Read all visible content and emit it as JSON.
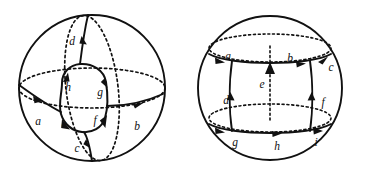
{
  "figure": {
    "title": "Two spheres with directed edge decompositions",
    "background_color": "#ffffff",
    "ink_color": "#111111",
    "panels": [
      {
        "id": "left-sphere",
        "name": "sphere-with-inner-loop",
        "center": [
          92,
          88
        ],
        "radius": 73,
        "description": "Sphere outline with dashed equator and dashed meridian, an inner rounded quadrilateral loop, and four edges joining the loop to the sphere.",
        "outer_boundary": "solid circle",
        "hidden_curves": [
          "dashed equator ellipse",
          "dashed meridian ellipse"
        ],
        "inner_region": "rounded quadrilateral loop",
        "edge_labels": [
          "a",
          "b",
          "c",
          "d",
          "e",
          "f",
          "g",
          "h"
        ],
        "edges": [
          {
            "label": "a",
            "label_pos": [
              38,
              122
            ],
            "direction": "right",
            "kind": "solid"
          },
          {
            "label": "b",
            "label_pos": [
              137,
              127
            ],
            "direction": "right",
            "kind": "solid"
          },
          {
            "label": "c",
            "label_pos": [
              77,
              149
            ],
            "direction": "up",
            "kind": "solid"
          },
          {
            "label": "d",
            "label_pos": [
              72,
              42
            ],
            "direction": "up",
            "kind": "solid"
          },
          {
            "label": "e",
            "label_pos": [
              64,
              125
            ],
            "direction": "down-left",
            "kind": "loop"
          },
          {
            "label": "f",
            "label_pos": [
              95,
              121
            ],
            "direction": "down-right",
            "kind": "loop"
          },
          {
            "label": "g",
            "label_pos": [
              100,
              93
            ],
            "direction": "down",
            "kind": "loop"
          },
          {
            "label": "h",
            "label_pos": [
              68,
              88
            ],
            "direction": "up-right",
            "kind": "loop"
          }
        ]
      },
      {
        "id": "right-sphere",
        "name": "sphere-with-banded-edges",
        "center": [
          270,
          88
        ],
        "radius": 72,
        "description": "Sphere outline with two dashed latitude ellipses, two solid latitude curves, three vertical edges, and nine labelled directed edges.",
        "outer_boundary": "solid circle",
        "hidden_curves": [
          "upper dashed latitude ellipse",
          "lower dashed latitude ellipse",
          "dashed central meridian segment"
        ],
        "edge_labels": [
          "a",
          "b",
          "c",
          "d",
          "e",
          "f",
          "g",
          "h",
          "i"
        ],
        "edges": [
          {
            "label": "a",
            "label_pos": [
              228,
              57
            ],
            "direction": "right",
            "kind": "solid"
          },
          {
            "label": "b",
            "label_pos": [
              290,
              59
            ],
            "direction": "right",
            "kind": "solid"
          },
          {
            "label": "c",
            "label_pos": [
              331,
              68
            ],
            "direction": "right",
            "kind": "solid"
          },
          {
            "label": "d",
            "label_pos": [
              226,
              101
            ],
            "direction": "up",
            "kind": "solid"
          },
          {
            "label": "e",
            "label_pos": [
              262,
              85
            ],
            "direction": "up",
            "kind": "dashed"
          },
          {
            "label": "f",
            "label_pos": [
              323,
              103
            ],
            "direction": "up",
            "kind": "solid"
          },
          {
            "label": "g",
            "label_pos": [
              235,
              143
            ],
            "direction": "right",
            "kind": "solid"
          },
          {
            "label": "h",
            "label_pos": [
              277,
              147
            ],
            "direction": "right",
            "kind": "solid"
          },
          {
            "label": "i",
            "label_pos": [
              316,
              143
            ],
            "direction": "right",
            "kind": "solid"
          }
        ]
      }
    ]
  }
}
